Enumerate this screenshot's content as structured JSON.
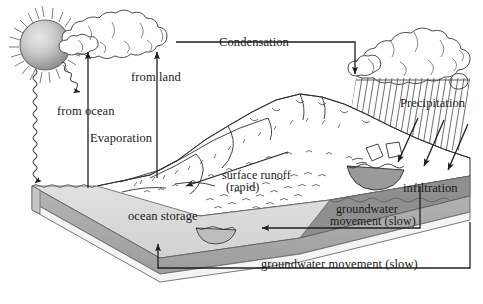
{
  "diagram": {
    "labels": {
      "condensation": "Condensation",
      "precipitation": "Precipitation",
      "evaporation": "Evaporation",
      "from_ocean": "from ocean",
      "from_land": "from land",
      "surface_runoff_line1": "surface runoff",
      "surface_runoff_line2": "(rapid)",
      "ocean_storage": "ocean storage",
      "infiltration": "infiltration",
      "groundwater_upper_line1": "groundwater",
      "groundwater_upper_line2": "movement (slow)",
      "groundwater_lower": "groundwater movement (slow)"
    },
    "colors": {
      "ink": "#1a1a1a",
      "line": "#2b2b2b",
      "ocean_top": "#d9d9d9",
      "ocean_front": "#a8a8a8",
      "ocean_side": "#bdbdbd",
      "ocean_deep": "#8f8f8f",
      "ocean_base": "#f2f2f2",
      "sun_core": "#cfcfcf",
      "sun_edge": "#8a8a8a",
      "lake_fill": "#9a9a9a",
      "background": "#ffffff"
    },
    "icons": {
      "sun": "sun-icon",
      "cloud_left": "cloud-icon",
      "cloud_rain": "rain-cloud-icon",
      "rain": "rain-hatch-icon",
      "mountain": "mountain-icon",
      "ocean": "ocean-block-icon",
      "lake": "lake-icon"
    }
  }
}
